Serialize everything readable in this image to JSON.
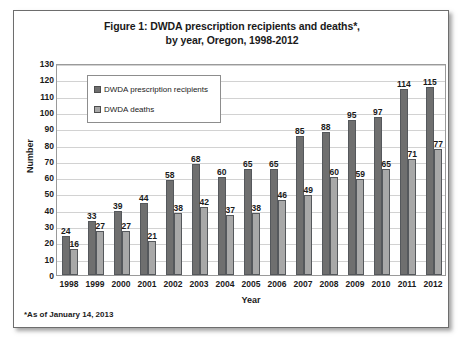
{
  "figure": {
    "title_line1": "Figure 1: DWDA prescription recipients and deaths*,",
    "title_line2": "by year, Oregon, 1998-2012",
    "footnote": "*As of January 14, 2013"
  },
  "colors": {
    "recipients": "#6f6f6f",
    "deaths": "#a8a8a8",
    "gridline": "#d2d2d2",
    "frame": "#6d6d6d"
  },
  "chart_data": {
    "type": "bar",
    "title": "Figure 1: DWDA prescription recipients and deaths*, by year, Oregon, 1998-2012",
    "xlabel": "Year",
    "ylabel": "Number",
    "ylim": [
      0,
      130
    ],
    "ytick_step": 10,
    "yticks": [
      0,
      10,
      20,
      30,
      40,
      50,
      60,
      70,
      80,
      90,
      100,
      110,
      120,
      130
    ],
    "grid": true,
    "legend_position": "upper-left-inside",
    "categories": [
      "1998",
      "1999",
      "2000",
      "2001",
      "2002",
      "2003",
      "2004",
      "2005",
      "2006",
      "2007",
      "2008",
      "2009",
      "2010",
      "2011",
      "2012"
    ],
    "series": [
      {
        "name": "DWDA prescription recipients",
        "values": [
          24,
          33,
          39,
          44,
          58,
          68,
          60,
          65,
          65,
          85,
          88,
          95,
          97,
          114,
          115
        ]
      },
      {
        "name": "DWDA deaths",
        "values": [
          16,
          27,
          27,
          21,
          38,
          42,
          37,
          38,
          46,
          49,
          60,
          59,
          65,
          71,
          77
        ]
      }
    ]
  }
}
